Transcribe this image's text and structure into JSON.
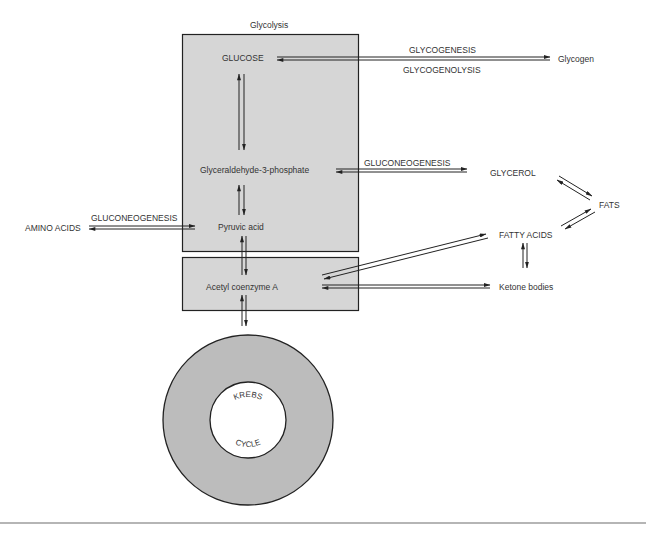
{
  "title": "Glycolysis",
  "colors": {
    "box_fill": "#d6d6d6",
    "ring_fill": "#b9b9b9",
    "stroke": "#222222"
  },
  "nodes": {
    "glucose": "GLUCOSE",
    "g3p": "Glyceraldehyde-3-phosphate",
    "pyruvic": "Pyruvic acid",
    "acetyl_coa": "Acetyl coenzyme A",
    "glycogen": "Glycogen",
    "glycerol": "GLYCEROL",
    "fats": "FATS",
    "fatty_acids": "FATTY ACIDS",
    "ketone": "Ketone bodies",
    "amino_acids": "AMINO ACIDS",
    "krebs_top": "KREBS",
    "krebs_bottom": "CYCLE"
  },
  "processes": {
    "glycogenesis": "GLYCOGENESIS",
    "glycogenolysis": "GLYCOGENOLYSIS",
    "gluconeogenesis_glycerol": "GLUCONEOGENESIS",
    "gluconeogenesis_amino": "GLUCONEOGENESIS"
  },
  "edges": [
    {
      "from": "GLUCOSE",
      "to": "Glycogen",
      "label": "GLYCOGENESIS",
      "reverse_label": "GLYCOGENOLYSIS"
    },
    {
      "from": "GLUCOSE",
      "to": "Glyceraldehyde-3-phosphate",
      "bidirectional": true
    },
    {
      "from": "Glyceraldehyde-3-phosphate",
      "to": "Pyruvic acid",
      "bidirectional": true
    },
    {
      "from": "Glyceraldehyde-3-phosphate",
      "to": "GLYCEROL",
      "label": "GLUCONEOGENESIS",
      "bidirectional": true
    },
    {
      "from": "GLYCEROL",
      "to": "FATS",
      "bidirectional": true
    },
    {
      "from": "FATTY ACIDS",
      "to": "FATS",
      "bidirectional": true
    },
    {
      "from": "AMINO ACIDS",
      "to": "Pyruvic acid",
      "label": "GLUCONEOGENESIS",
      "bidirectional": true
    },
    {
      "from": "Pyruvic acid",
      "to": "Acetyl coenzyme A",
      "bidirectional": true
    },
    {
      "from": "Acetyl coenzyme A",
      "to": "FATTY ACIDS",
      "bidirectional": true
    },
    {
      "from": "Acetyl coenzyme A",
      "to": "Ketone bodies",
      "bidirectional": true
    },
    {
      "from": "FATTY ACIDS",
      "to": "Ketone bodies",
      "bidirectional": true
    },
    {
      "from": "Acetyl coenzyme A",
      "to": "KREBS CYCLE",
      "bidirectional": true
    }
  ]
}
